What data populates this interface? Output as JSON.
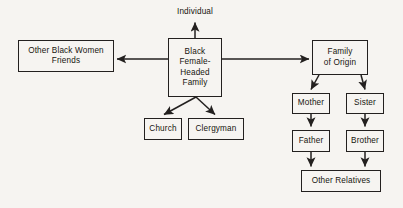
{
  "diagram": {
    "background_color": "#f6f4f1",
    "line_color": "#23201f",
    "text_color": "#17150f",
    "labels": {
      "individual": "Individual"
    },
    "nodes": [
      {
        "id": "other-black-women-friends",
        "label": "Other Black Women\nFriends",
        "x": 18,
        "y": 40,
        "w": 96,
        "h": 32
      },
      {
        "id": "black-female-headed-family",
        "label": "Black\nFemale-\nHeaded\nFamily",
        "x": 168,
        "y": 38,
        "w": 54,
        "h": 59
      },
      {
        "id": "family-of-origin",
        "label": "Family\nof Origin",
        "x": 312,
        "y": 40,
        "w": 56,
        "h": 35
      },
      {
        "id": "church",
        "label": "Church",
        "x": 144,
        "y": 118,
        "w": 38,
        "h": 22
      },
      {
        "id": "clergyman",
        "label": "Clergyman",
        "x": 188,
        "y": 118,
        "w": 56,
        "h": 22
      },
      {
        "id": "mother",
        "label": "Mother",
        "x": 292,
        "y": 93,
        "w": 38,
        "h": 21
      },
      {
        "id": "sister",
        "label": "Sister",
        "x": 346,
        "y": 93,
        "w": 38,
        "h": 21
      },
      {
        "id": "father",
        "label": "Father",
        "x": 292,
        "y": 130,
        "w": 38,
        "h": 22
      },
      {
        "id": "brother",
        "label": "Brother",
        "x": 346,
        "y": 130,
        "w": 38,
        "h": 22
      },
      {
        "id": "other-relatives",
        "label": "Other Relatives",
        "x": 301,
        "y": 170,
        "w": 80,
        "h": 22
      }
    ],
    "edges": [
      {
        "id": "family-to-individual",
        "from": "black-female-headed-family",
        "to": "individual",
        "kind": "arrow-up"
      },
      {
        "id": "family-to-friends",
        "from": "black-female-headed-family",
        "to": "other-black-women-friends",
        "kind": "arrow-left"
      },
      {
        "id": "family-to-family-of-origin",
        "from": "black-female-headed-family",
        "to": "family-of-origin",
        "kind": "arrow-right"
      },
      {
        "id": "family-to-church",
        "from": "black-female-headed-family",
        "to": "church",
        "kind": "arrow-diagonal"
      },
      {
        "id": "family-to-clergyman",
        "from": "black-female-headed-family",
        "to": "clergyman",
        "kind": "arrow-diagonal"
      },
      {
        "id": "origin-to-mother",
        "from": "family-of-origin",
        "to": "mother",
        "kind": "arrow-diagonal"
      },
      {
        "id": "origin-to-sister",
        "from": "family-of-origin",
        "to": "sister",
        "kind": "arrow-diagonal"
      },
      {
        "id": "mother-to-father",
        "from": "mother",
        "to": "father",
        "kind": "arrow-down"
      },
      {
        "id": "sister-to-brother",
        "from": "sister",
        "to": "brother",
        "kind": "arrow-down"
      },
      {
        "id": "father-to-other-relatives",
        "from": "father",
        "to": "other-relatives",
        "kind": "arrow-down"
      },
      {
        "id": "brother-to-other-relatives",
        "from": "brother",
        "to": "other-relatives",
        "kind": "arrow-down"
      }
    ]
  }
}
